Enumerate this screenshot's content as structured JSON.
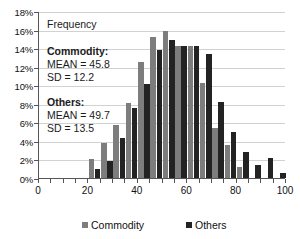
{
  "chart_data": {
    "type": "bar",
    "title": "",
    "xlabel": "",
    "ylabel": "Frequency",
    "ylim": [
      0,
      18
    ],
    "ytick_labels": [
      "0%",
      "2%",
      "4%",
      "6%",
      "8%",
      "10%",
      "12%",
      "14%",
      "16%",
      "18%"
    ],
    "ytick_values": [
      0,
      2,
      4,
      6,
      8,
      10,
      12,
      14,
      16,
      18
    ],
    "xlim": [
      0,
      100
    ],
    "xtick_labels": [
      "0",
      "20",
      "40",
      "60",
      "80",
      "100"
    ],
    "xtick_values": [
      0,
      20,
      40,
      60,
      80,
      100
    ],
    "grid": true,
    "legend_position": "bottom",
    "bin_width": 5,
    "categories": [
      20,
      25,
      30,
      35,
      40,
      45,
      50,
      55,
      60,
      65,
      70,
      75,
      80,
      85,
      90,
      95
    ],
    "series": [
      {
        "name": "Commodity",
        "color": "#7d7d7d",
        "values": [
          2.0,
          3.8,
          5.7,
          8.1,
          12.5,
          15.2,
          15.8,
          14.2,
          14.2,
          10.2,
          5.4,
          3.6,
          1.2,
          0.0,
          0.0,
          0.0
        ]
      },
      {
        "name": "Others",
        "color": "#232323",
        "values": [
          1.0,
          1.8,
          4.3,
          7.6,
          10.1,
          13.8,
          14.9,
          14.2,
          14.2,
          13.4,
          8.2,
          5.0,
          2.8,
          1.4,
          2.2,
          0.5
        ]
      }
    ],
    "annotations": {
      "frequency_label": "Frequency",
      "commodity_stats": {
        "heading": "Commodity:",
        "mean": "MEAN = 45.8",
        "sd": "SD = 12.2"
      },
      "others_stats": {
        "heading": "Others:",
        "mean": "MEAN = 49.7",
        "sd": "SD = 13.5"
      }
    }
  },
  "legend": {
    "commodity_label": "Commodity",
    "others_label": "Others"
  },
  "colors": {
    "commodity": "#7d7d7d",
    "others": "#232323",
    "axis": "#555555",
    "grid": "#d2d2d2"
  }
}
